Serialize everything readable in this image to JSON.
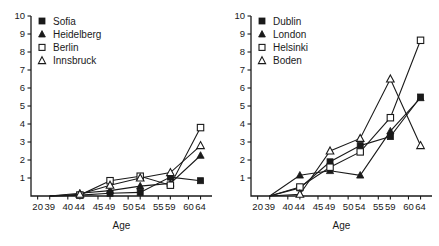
{
  "figure": {
    "background_color": "#ffffff",
    "ink_color": "#1a1a1a",
    "panel_count": 2
  },
  "chart_data": [
    {
      "type": "line",
      "title": "",
      "panel": "left",
      "xlabel": "Age",
      "ylabel": "",
      "grid": false,
      "legend_position": "top-left",
      "categories": [
        "20-39",
        "40-44",
        "45-49",
        "50-54",
        "55-59",
        "60-64"
      ],
      "tick_labels": [
        "20",
        "39",
        "40",
        "44",
        "45",
        "49",
        "50",
        "54",
        "55",
        "59",
        "60",
        "64"
      ],
      "y_ticks": [
        1,
        2,
        3,
        4,
        5,
        6,
        7,
        8,
        9,
        10
      ],
      "ylim": [
        0,
        10
      ],
      "series": [
        {
          "name": "Sofia",
          "marker": "filled-square",
          "values": [
            0.0,
            0.05,
            0.15,
            0.2,
            1.05,
            0.85
          ]
        },
        {
          "name": "Heidelberg",
          "marker": "filled-triangle",
          "values": [
            0.0,
            0.15,
            0.3,
            0.55,
            0.7,
            2.25
          ]
        },
        {
          "name": "Berlin",
          "marker": "open-square",
          "values": [
            0.0,
            0.05,
            0.85,
            1.1,
            0.6,
            3.8
          ]
        },
        {
          "name": "Innsbruck",
          "marker": "open-triangle",
          "values": [
            0.0,
            0.1,
            0.6,
            1.0,
            1.3,
            2.8
          ]
        }
      ]
    },
    {
      "type": "line",
      "title": "",
      "panel": "right",
      "xlabel": "Age",
      "ylabel": "",
      "grid": false,
      "legend_position": "top-left",
      "categories": [
        "20-39",
        "40-44",
        "45-49",
        "50-54",
        "55-59",
        "60-64"
      ],
      "tick_labels": [
        "20",
        "39",
        "40",
        "44",
        "45",
        "49",
        "50",
        "54",
        "55",
        "59",
        "60",
        "64"
      ],
      "y_ticks": [
        1,
        2,
        3,
        4,
        5,
        6,
        7,
        8,
        9,
        10
      ],
      "ylim": [
        0,
        10
      ],
      "series": [
        {
          "name": "Dublin",
          "marker": "filled-square",
          "values": [
            0.0,
            0.45,
            1.9,
            2.8,
            3.3,
            5.5
          ]
        },
        {
          "name": "London",
          "marker": "filled-triangle",
          "values": [
            0.0,
            1.15,
            1.4,
            1.15,
            3.6,
            5.45
          ]
        },
        {
          "name": "Helsinki",
          "marker": "open-square",
          "values": [
            0.0,
            0.5,
            1.6,
            2.45,
            4.35,
            8.65
          ]
        },
        {
          "name": "Boden",
          "marker": "open-triangle",
          "values": [
            0.0,
            0.1,
            2.5,
            3.2,
            6.5,
            2.8
          ]
        }
      ]
    }
  ]
}
